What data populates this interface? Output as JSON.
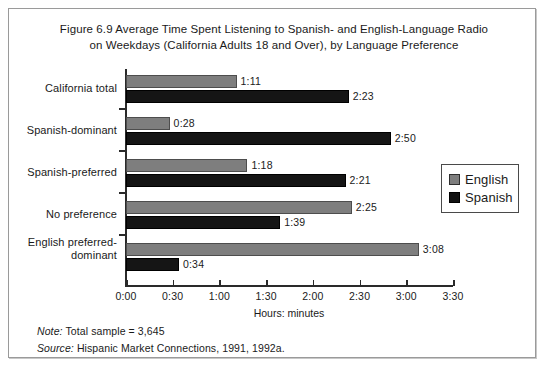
{
  "figure": {
    "title_line1": "Figure 6.9   Average Time Spent Listening to Spanish- and English-Language Radio",
    "title_line2": "on Weekdays (California Adults 18 and Over), by Language Preference",
    "note_lead": "Note:",
    "note_text": " Total sample = 3,645",
    "source_lead": "Source:",
    "source_text": " Hispanic Market Connections, 1991, 1992a."
  },
  "chart_data": {
    "type": "bar",
    "orientation": "horizontal",
    "title": "Figure 6.9   Average Time Spent Listening to Spanish- and English-Language Radio on Weekdays (California Adults 18 and Over), by Language Preference",
    "xlabel": "Hours: minutes",
    "ylabel": "",
    "grid": false,
    "legend_position": "right",
    "xlim_minutes": [
      0,
      210
    ],
    "xticks_minutes": [
      0,
      30,
      60,
      90,
      120,
      150,
      180,
      210
    ],
    "xtick_labels": [
      "0:00",
      "0:30",
      "1:00",
      "1:30",
      "2:00",
      "2:30",
      "3:00",
      "3:30"
    ],
    "categories": [
      "California total",
      "Spanish-dominant",
      "Spanish-preferred",
      "No preference",
      "English preferred-dominant"
    ],
    "series": [
      {
        "name": "English",
        "color": "#7e7e7e",
        "values": [
          71,
          28,
          78,
          145,
          188
        ],
        "labels": [
          "1:11",
          "0:28",
          "1:18",
          "2:25",
          "3:08"
        ]
      },
      {
        "name": "Spanish",
        "color": "#151515",
        "values": [
          143,
          170,
          141,
          99,
          34
        ],
        "labels": [
          "2:23",
          "2:50",
          "2:21",
          "1:39",
          "0:34"
        ]
      }
    ]
  },
  "legend": {
    "items": [
      {
        "label": "English"
      },
      {
        "label": "Spanish"
      }
    ]
  }
}
